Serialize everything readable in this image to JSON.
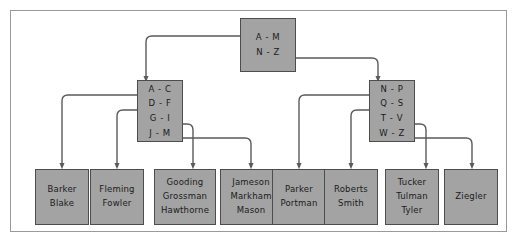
{
  "figure": {
    "frame_border_color": "#9a9a9a",
    "node_fill_color": "#a3a3a3",
    "node_border_color": "#4d4d4d",
    "edge_color": "#5a5a5a",
    "text_color": "#1b1b1b",
    "background_color": "#ffffff"
  },
  "tree": {
    "root": {
      "name": "root-node",
      "keys": [
        "A - M",
        "N - Z"
      ]
    },
    "internal": [
      {
        "name": "internal-node-left",
        "keys": [
          "A - C",
          "D - F",
          "G - I",
          "J - M"
        ]
      },
      {
        "name": "internal-node-right",
        "keys": [
          "N - P",
          "Q - S",
          "T - V",
          "W - Z"
        ]
      }
    ],
    "leaves": [
      {
        "name": "leaf-node-1",
        "entries": [
          "Barker",
          "Blake"
        ]
      },
      {
        "name": "leaf-node-2",
        "entries": [
          "Fleming",
          "Fowler"
        ]
      },
      {
        "name": "leaf-node-3",
        "entries": [
          "Gooding",
          "Grossman",
          "Hawthorne"
        ]
      },
      {
        "name": "leaf-node-4",
        "entries": [
          "Jameson",
          "Markham",
          "Mason"
        ]
      },
      {
        "name": "leaf-node-5",
        "entries": [
          "Parker",
          "Portman"
        ]
      },
      {
        "name": "leaf-node-6",
        "entries": [
          "Roberts",
          "Smith"
        ]
      },
      {
        "name": "leaf-node-7",
        "entries": [
          "Tucker",
          "Tulman",
          "Tyler"
        ]
      },
      {
        "name": "leaf-node-8",
        "entries": [
          "Ziegler"
        ]
      }
    ]
  }
}
